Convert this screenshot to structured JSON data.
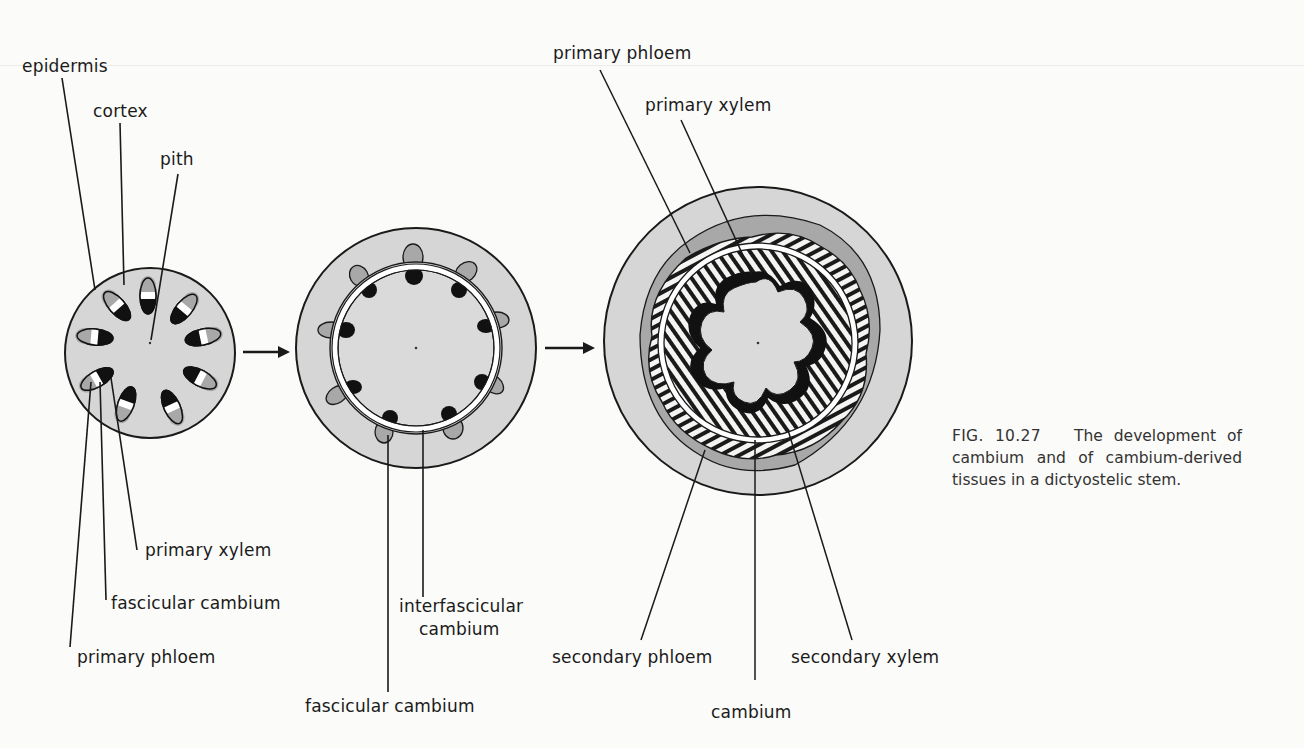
{
  "figure": {
    "number": "FIG. 10.27",
    "caption": "The development of cambium and of cambium-derived tissues in a dictyostelic stem.",
    "colors": {
      "background": "#fbfbf9",
      "cortex_fill": "#d6d6d6",
      "pith_fill": "#dadada",
      "phloem_fill": "#a8a8a8",
      "xylem_fill": "#111111",
      "outline": "#1a1a1a"
    },
    "stages": [
      {
        "id": "stage-1-primary",
        "labels": {
          "epidermis": "epidermis",
          "cortex": "cortex",
          "pith": "pith",
          "primary_xylem": "primary xylem",
          "fascicular_cambium": "fascicular cambium",
          "primary_phloem": "primary phloem"
        },
        "vascular_bundle_count": 10
      },
      {
        "id": "stage-2-cambium-ring",
        "labels": {
          "interfascicular_cambium_line1": "interfascicular",
          "interfascicular_cambium_line2": "cambium",
          "fascicular_cambium": "fascicular cambium"
        },
        "vascular_bundle_count": 10
      },
      {
        "id": "stage-3-secondary-growth",
        "labels": {
          "primary_phloem": "primary phloem",
          "primary_xylem": "primary xylem",
          "secondary_phloem": "secondary phloem",
          "cambium": "cambium",
          "secondary_xylem": "secondary xylem"
        },
        "pith_lobes": 9
      }
    ],
    "arrows": [
      {
        "from": "stage-1-primary",
        "to": "stage-2-cambium-ring"
      },
      {
        "from": "stage-2-cambium-ring",
        "to": "stage-3-secondary-growth"
      }
    ]
  }
}
